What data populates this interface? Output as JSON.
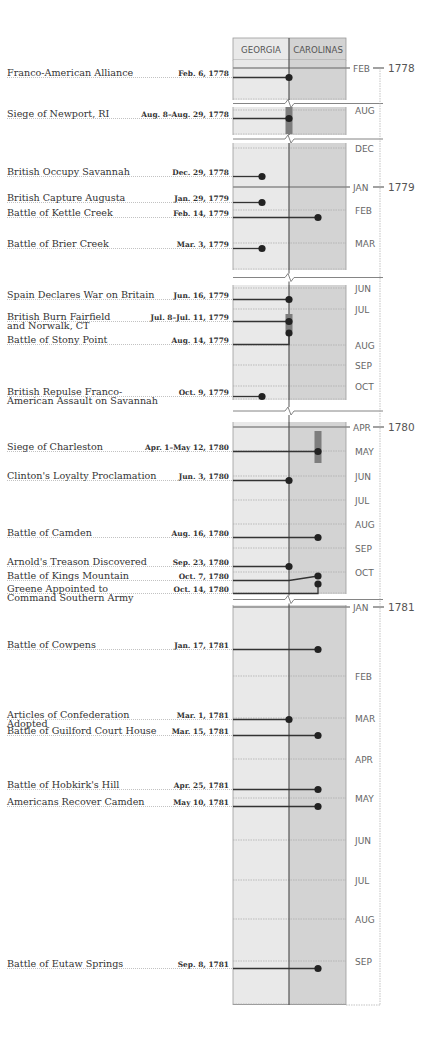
{
  "chart_data": {
    "type": "timeline",
    "title": "",
    "columns": [
      {
        "key": "georgia",
        "label": "GEORGIA",
        "color": "#e9e9e9"
      },
      {
        "key": "carolinas",
        "label": "CAROLINAS",
        "color": "#d3d3d3"
      }
    ],
    "colors": {
      "line": "#333333",
      "dot": "#222222",
      "range_bar": "#7d7d7d",
      "divider": "#555555",
      "year_rule": "#8a8a8a",
      "grid": "#a9a9a9"
    },
    "segments": [
      {
        "months": [
          {
            "label": "FEB",
            "year": "1778"
          }
        ]
      },
      {
        "months": [
          {
            "label": "AUG"
          }
        ]
      },
      {
        "months": [
          {
            "label": "DEC"
          },
          {
            "label": "JAN",
            "year": "1779"
          },
          {
            "label": "FEB"
          },
          {
            "label": "MAR"
          }
        ]
      },
      {
        "months": [
          {
            "label": "JUN"
          },
          {
            "label": "JUL"
          },
          {
            "label": "AUG"
          },
          {
            "label": "SEP"
          },
          {
            "label": "OCT"
          }
        ]
      },
      {
        "months": [
          {
            "label": "APR",
            "year": "1780"
          },
          {
            "label": "MAY"
          },
          {
            "label": "JUN"
          },
          {
            "label": "JUL"
          },
          {
            "label": "AUG"
          },
          {
            "label": "SEP"
          },
          {
            "label": "OCT"
          }
        ]
      },
      {
        "months": [
          {
            "label": "JAN",
            "year": "1781"
          },
          {
            "label": "FEB"
          },
          {
            "label": "MAR"
          },
          {
            "label": "APR"
          },
          {
            "label": "MAY"
          },
          {
            "label": "JUN"
          },
          {
            "label": "JUL"
          },
          {
            "label": "AUG"
          },
          {
            "label": "SEP"
          }
        ]
      }
    ],
    "events": [
      {
        "name": [
          "Franco-American Alliance"
        ],
        "date": "Feb. 6, 1778",
        "region": "border",
        "segment": 0
      },
      {
        "name": [
          "Siege of Newport, RI"
        ],
        "date": "Aug. 8–Aug. 29, 1778",
        "region": "border",
        "segment": 1,
        "range": true
      },
      {
        "name": [
          "British Occupy Savannah"
        ],
        "date": "Dec. 29, 1778",
        "region": "georgia",
        "segment": 2
      },
      {
        "name": [
          "British Capture Augusta"
        ],
        "date": "Jan. 29, 1779",
        "region": "georgia",
        "segment": 2
      },
      {
        "name": [
          "Battle of Kettle Creek"
        ],
        "date": "Feb. 14, 1779",
        "region": "carolinas",
        "segment": 2
      },
      {
        "name": [
          "Battle of Brier Creek"
        ],
        "date": "Mar. 3, 1779",
        "region": "georgia",
        "segment": 2
      },
      {
        "name": [
          "Spain Declares War on Britain"
        ],
        "date": "Jun. 16, 1779",
        "region": "border",
        "segment": 3
      },
      {
        "name": [
          "British Burn Fairfield",
          "and Norwalk, CT"
        ],
        "date": "Jul. 8–Jul. 11, 1779",
        "region": "border",
        "segment": 3,
        "range": true
      },
      {
        "name": [
          "Battle of Stony Point"
        ],
        "date": "Aug. 14, 1779",
        "region": "border",
        "segment": 3
      },
      {
        "name": [
          "British Repulse Franco-",
          "American Assault on Savannah"
        ],
        "date": "Oct. 9, 1779",
        "region": "georgia",
        "segment": 3
      },
      {
        "name": [
          "Siege of Charleston"
        ],
        "date": "Apr. 1–May 12, 1780",
        "region": "carolinas",
        "segment": 4,
        "range": true
      },
      {
        "name": [
          "Clinton's Loyalty Proclamation"
        ],
        "date": "Jun. 3, 1780",
        "region": "border",
        "segment": 4
      },
      {
        "name": [
          "Battle of Camden"
        ],
        "date": "Aug. 16, 1780",
        "region": "carolinas",
        "segment": 4
      },
      {
        "name": [
          "Arnold's Treason Discovered"
        ],
        "date": "Sep. 23, 1780",
        "region": "border",
        "segment": 4
      },
      {
        "name": [
          "Battle of Kings Mountain"
        ],
        "date": "Oct. 7, 1780",
        "region": "carolinas",
        "segment": 4
      },
      {
        "name": [
          "Greene Appointed to",
          "Command Southern Army"
        ],
        "date": "Oct. 14, 1780",
        "region": "carolinas",
        "segment": 4
      },
      {
        "name": [
          "Battle of Cowpens"
        ],
        "date": "Jan. 17, 1781",
        "region": "carolinas",
        "segment": 5
      },
      {
        "name": [
          "Articles of Confederation",
          "Adopted"
        ],
        "date": "Mar. 1, 1781",
        "region": "border",
        "segment": 5
      },
      {
        "name": [
          "Battle of Guilford Court House"
        ],
        "date": "Mar. 15, 1781",
        "region": "carolinas",
        "segment": 5
      },
      {
        "name": [
          "Battle of Hobkirk's Hill"
        ],
        "date": "Apr. 25, 1781",
        "region": "carolinas",
        "segment": 5
      },
      {
        "name": [
          "Americans Recover Camden"
        ],
        "date": "May 10, 1781",
        "region": "carolinas",
        "segment": 5
      },
      {
        "name": [
          "Battle of Eutaw Springs"
        ],
        "date": "Sep. 8, 1781",
        "region": "carolinas",
        "segment": 5
      }
    ]
  }
}
